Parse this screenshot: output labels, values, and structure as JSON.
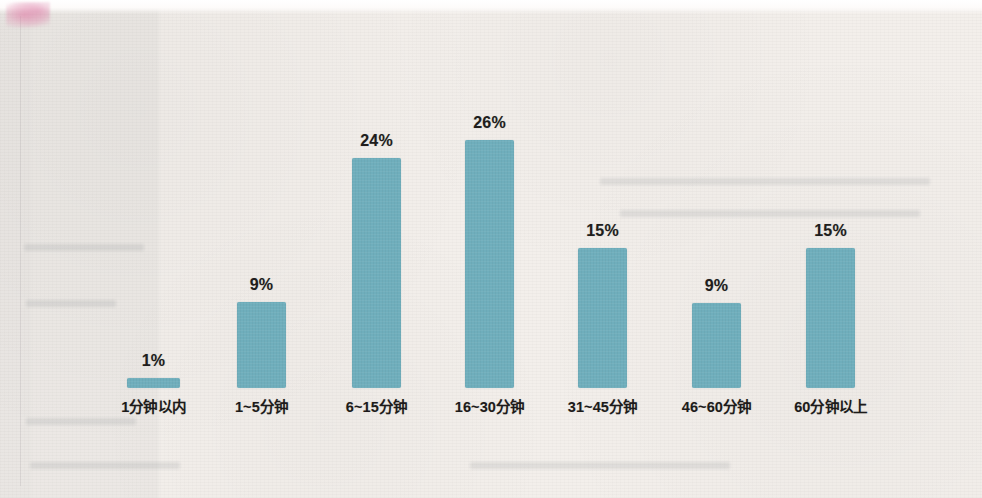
{
  "figure": {
    "media": "scanned-book-page",
    "paper_color": "#f3efeb",
    "bar_color": "#6faebc",
    "label_color": "#201d1c"
  },
  "chart_data": {
    "type": "bar",
    "title": "",
    "subtitle": "",
    "xlabel": "",
    "ylabel": "",
    "grid": false,
    "legend": false,
    "ylim": [
      0,
      28
    ],
    "value_suffix": "%",
    "categories": [
      "1分钟以内",
      "1~5分钟",
      "6~15分钟",
      "16~30分钟",
      "31~45分钟",
      "46~60分钟",
      "60分钟以上"
    ],
    "values": [
      1,
      9,
      24,
      26,
      15,
      9,
      15
    ],
    "value_labels": [
      "1%",
      "9%",
      "24%",
      "26%",
      "15%",
      "9%",
      "15%"
    ],
    "bars": [
      {
        "category": "1分钟以内",
        "value": 1,
        "label": "1%",
        "x": 127,
        "width": 53,
        "top": 378,
        "height": 10
      },
      {
        "category": "1~5分钟",
        "value": 9,
        "label": "9%",
        "x": 237,
        "width": 49,
        "top": 302,
        "height": 86
      },
      {
        "category": "6~15分钟",
        "value": 24,
        "label": "24%",
        "x": 352,
        "width": 49,
        "top": 158,
        "height": 230
      },
      {
        "category": "16~30分钟",
        "value": 26,
        "label": "26%",
        "x": 465,
        "width": 49,
        "top": 140,
        "height": 248
      },
      {
        "category": "31~45分钟",
        "value": 15,
        "label": "15%",
        "x": 578,
        "width": 49,
        "top": 248,
        "height": 140
      },
      {
        "category": "46~60分钟",
        "value": 9,
        "label": "9%",
        "x": 692,
        "width": 49,
        "top": 303,
        "height": 85
      },
      {
        "category": "60分钟以上",
        "value": 15,
        "label": "15%",
        "x": 806,
        "width": 49,
        "top": 248,
        "height": 140
      }
    ]
  }
}
